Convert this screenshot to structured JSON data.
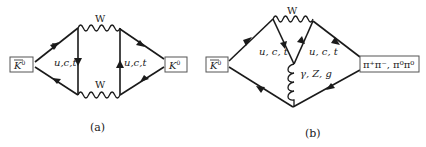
{
  "diagrams": [
    {
      "id": "a",
      "caption": "(a)",
      "initial_state": {
        "particle": "K",
        "bar": true,
        "superscript": "0"
      },
      "final_state": {
        "particle": "K",
        "bar": false,
        "superscript": "0"
      },
      "boson_top": "W",
      "boson_bottom": "W",
      "quark_left": "u,c,t",
      "quark_right": "u,c,t",
      "type": "box diagram"
    },
    {
      "id": "b",
      "caption": "(b)",
      "initial_state": {
        "particle": "K",
        "bar": true,
        "superscript": "0"
      },
      "final_state": {
        "text": "π⁺π⁻, π⁰π⁰"
      },
      "boson_top": "W",
      "quark_left": "u, c, t",
      "quark_right": "u, c, t",
      "penguin_boson": "γ, Z, g",
      "type": "penguin diagram"
    }
  ],
  "colors": {
    "line": "#1a1a1a",
    "box_border": "#555555",
    "background": "#ffffff"
  }
}
